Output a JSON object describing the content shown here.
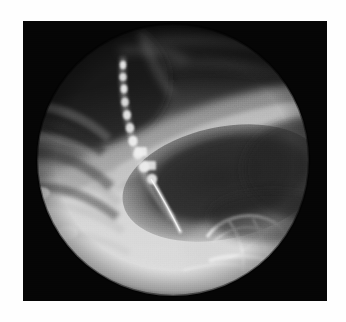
{
  "page": {
    "background_color": "#fefefe",
    "width": 346,
    "height": 322,
    "caption": ""
  },
  "radiograph": {
    "modality_label": "fluoroscopic-radiograph",
    "frame": {
      "x": 23,
      "y": 21,
      "width": 304,
      "height": 280,
      "background_color": "#050505"
    },
    "field_of_view": {
      "shape": "circle",
      "center_x": 150,
      "center_y": 139,
      "radius": 136,
      "collimator_color": "#050505"
    },
    "tones": {
      "brightest": "#e8e8e8",
      "soft_tissue": "#c8c8c8",
      "mid": "#8c8c8c",
      "gas_dark": "#2a2a2a",
      "lung_dark": "#1a1a1a",
      "black": "#050505",
      "contrast_bright": "#f2f2f2"
    },
    "regions": [
      {
        "name": "upper-lung-field",
        "description": "dark gas-filled upper zone occupying the top half of the circular field",
        "tone": "#1e1e1e"
      },
      {
        "name": "diaphragm-dome",
        "description": "bright curved soft-tissue band sweeping from mid-left up toward the upper right",
        "tone": "#b4b4b4"
      },
      {
        "name": "gastric-gas-bubble",
        "description": "large dark oval gas collection in the centre-right of the field",
        "tone": "#303030"
      },
      {
        "name": "soft-tissue-lower-field",
        "description": "very bright homogeneous soft-tissue region filling the lower third",
        "tone": "#dcdcdc"
      },
      {
        "name": "rib-shadows",
        "description": "oblique striped rib shadows across the left side of the field",
        "tone": "#707070"
      },
      {
        "name": "vertebral-column",
        "description": "segmented bright beaded column running from upper-left downward to centre",
        "tone": "#e0e0e0"
      },
      {
        "name": "contrast-filled-duct-loops",
        "description": "bright curved tubular loops of contrast in the lower right quadrant",
        "tone": "#f0f0f0"
      },
      {
        "name": "catheter-tip",
        "description": "thin bright linear catheter descending toward the centre of the field",
        "tone": "#ededed"
      }
    ]
  }
}
